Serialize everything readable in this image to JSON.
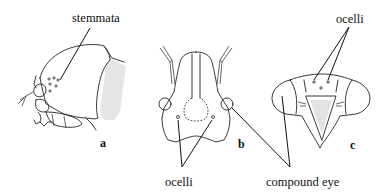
{
  "figure": {
    "panels": [
      {
        "id": "a",
        "label": "a",
        "view": "larval head, lateral"
      },
      {
        "id": "b",
        "label": "b",
        "view": "adult head, frontal"
      },
      {
        "id": "c",
        "label": "c",
        "view": "adult head, frontal (broad)"
      }
    ],
    "annotations": {
      "stemmata": "stemmata",
      "ocelli_b": "ocelli",
      "ocelli_c": "ocelli",
      "compound_eye": "compound eye"
    },
    "colors": {
      "ink": "#222222",
      "background": "#ffffff",
      "stipple": "#cfcfcf"
    }
  }
}
